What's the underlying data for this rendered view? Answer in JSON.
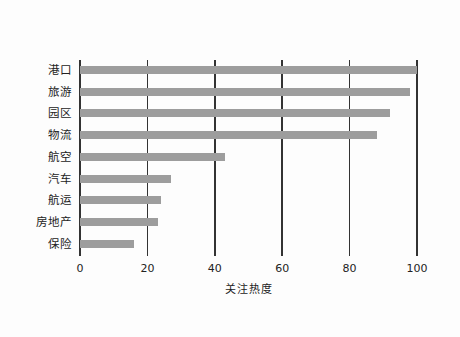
{
  "chart_data": {
    "type": "bar",
    "orientation": "horizontal",
    "title": "",
    "xlabel": "关注热度",
    "ylabel": "",
    "categories": [
      "港口",
      "旅游",
      "园区",
      "物流",
      "航空",
      "汽车",
      "航运",
      "房地产",
      "保险"
    ],
    "values": [
      100,
      98,
      92,
      88,
      43,
      27,
      24,
      23,
      16
    ],
    "xlim": [
      0,
      100
    ],
    "xticks": [
      "0",
      "20",
      "40",
      "60",
      "80",
      "100"
    ],
    "grid": "vertical",
    "legend": null,
    "bar_color": "#9d9d9d"
  }
}
